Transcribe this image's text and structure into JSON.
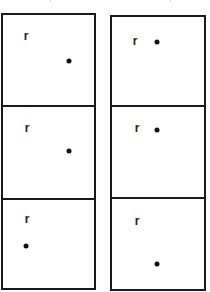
{
  "diagram": {
    "columns": [
      {
        "id": "left",
        "box": {
          "x": 1,
          "y": 13,
          "w": 95,
          "h": 277
        },
        "dividers_y": [
          105,
          198
        ],
        "panels": [
          {
            "label": "r",
            "label_pos": {
              "x": 26,
              "y": 37
            },
            "dot_pos": {
              "x": 69,
              "y": 61
            }
          },
          {
            "label": "r",
            "label_pos": {
              "x": 27,
              "y": 129
            },
            "dot_pos": {
              "x": 69,
              "y": 151
            }
          },
          {
            "label": "r",
            "label_pos": {
              "x": 27,
              "y": 220
            },
            "dot_pos": {
              "x": 26,
              "y": 246
            }
          }
        ]
      },
      {
        "id": "right",
        "box": {
          "x": 110,
          "y": 15,
          "w": 96,
          "h": 276
        },
        "dividers_y": [
          105,
          197
        ],
        "panels": [
          {
            "label": "r",
            "label_pos": {
              "x": 135,
              "y": 42
            },
            "dot_pos": {
              "x": 157,
              "y": 42
            }
          },
          {
            "label": "r",
            "label_pos": {
              "x": 137,
              "y": 129
            },
            "dot_pos": {
              "x": 157,
              "y": 130
            }
          },
          {
            "label": "r",
            "label_pos": {
              "x": 137,
              "y": 222
            },
            "dot_pos": {
              "x": 157,
              "y": 264
            }
          }
        ]
      }
    ],
    "colors": {
      "stroke": "#1a1a1a",
      "dot": "#111111",
      "label": "#222222",
      "background": "#ffffff"
    }
  }
}
